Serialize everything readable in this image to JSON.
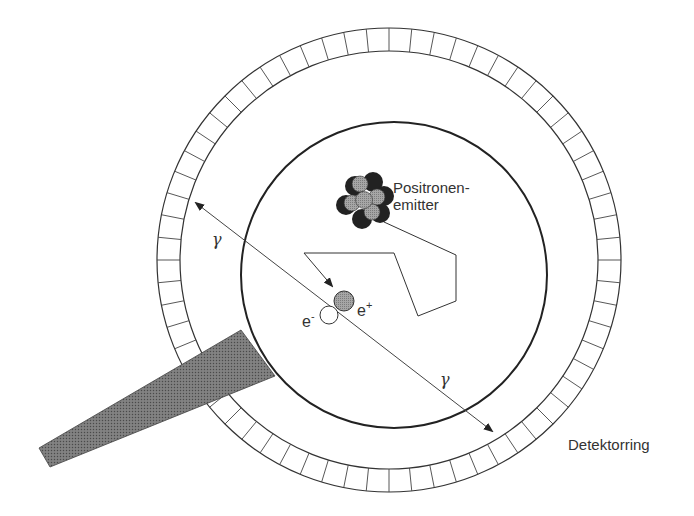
{
  "diagram": {
    "type": "PET detector ring schematic",
    "labels": {
      "emitter_line1": "Positronen-",
      "emitter_line2": "emitter",
      "electron": "e",
      "electron_sup": "-",
      "positron": "e",
      "positron_sup": "+",
      "gamma_upper": "γ",
      "gamma_lower": "γ",
      "detector_ring": "Detektorring"
    },
    "colors": {
      "stroke": "#333333",
      "bed_fill": "#666666",
      "positron_fill": "#9a9a9a",
      "nucleus_dark": "#222222",
      "nucleus_light": "#a8a8a8"
    },
    "geometry": {
      "detector_ring": {
        "cx": 389,
        "cy": 260,
        "r_outer": 232,
        "r_inner": 209,
        "segments": 64
      },
      "field_circle": {
        "cx": 394,
        "cy": 275,
        "r": 153
      },
      "gamma_line": {
        "x1": 190,
        "y1": 198,
        "x2": 496,
        "y2": 434
      },
      "positron": {
        "cx": 344,
        "cy": 301,
        "r": 10
      },
      "electron": {
        "cx": 329,
        "cy": 315,
        "r": 9
      },
      "path_points": [
        [
          384,
          222
        ],
        [
          456,
          255
        ],
        [
          456,
          301
        ],
        [
          418,
          316
        ],
        [
          394,
          253
        ],
        [
          304,
          253
        ],
        [
          332,
          286
        ]
      ],
      "bed_polygon": [
        [
          39,
          448
        ],
        [
          241,
          330
        ],
        [
          275,
          376
        ],
        [
          50,
          467
        ]
      ]
    }
  }
}
